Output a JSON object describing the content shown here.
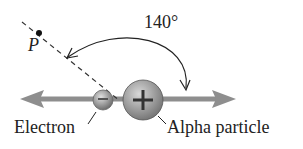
{
  "angle_label": "140°",
  "point_label": "P",
  "electron_label": "Electron",
  "alpha_label": "Alpha particle",
  "electron_sign": "−",
  "alpha_sign": "+",
  "colors": {
    "arrow": "#8e8e8e",
    "particle": "#9a9a9a",
    "line": "#222222"
  }
}
